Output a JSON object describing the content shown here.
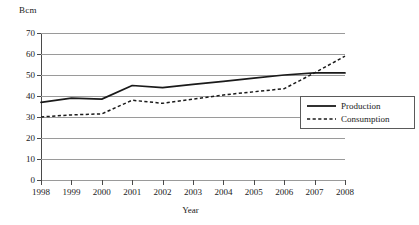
{
  "chart_data": {
    "type": "line",
    "title": "",
    "xlabel": "Year",
    "ylabel": "Bcm",
    "y_unit_label": "Bcm",
    "categories": [
      "1998",
      "1999",
      "2000",
      "2001",
      "2002",
      "2003",
      "2004",
      "2005",
      "2006",
      "2007",
      "2008"
    ],
    "x": [
      1998,
      1999,
      2000,
      2001,
      2002,
      2003,
      2004,
      2005,
      2006,
      2007,
      2008
    ],
    "xlim": [
      1998,
      2008
    ],
    "ylim": [
      0,
      70
    ],
    "y_ticks": [
      0,
      10,
      20,
      30,
      40,
      50,
      60,
      70
    ],
    "y_tick_labels": [
      "0",
      "10",
      "20",
      "30",
      "40",
      "50",
      "60",
      "70"
    ],
    "grid": true,
    "grid_axis": "y",
    "legend_position": "right",
    "series": [
      {
        "name": "Production",
        "style": "solid",
        "color": "#1a1a1a",
        "values": [
          37,
          39,
          38.5,
          45,
          44,
          45.5,
          47,
          48.5,
          50,
          51,
          51
        ]
      },
      {
        "name": "Consumption",
        "style": "dashed",
        "color": "#1a1a1a",
        "values": [
          30,
          31,
          31.5,
          38,
          36.5,
          38.5,
          40.5,
          42,
          43.5,
          51,
          59
        ]
      }
    ]
  },
  "legend": {
    "items": [
      {
        "label": "Production",
        "style": "solid"
      },
      {
        "label": "Consumption",
        "style": "dashed"
      }
    ]
  }
}
